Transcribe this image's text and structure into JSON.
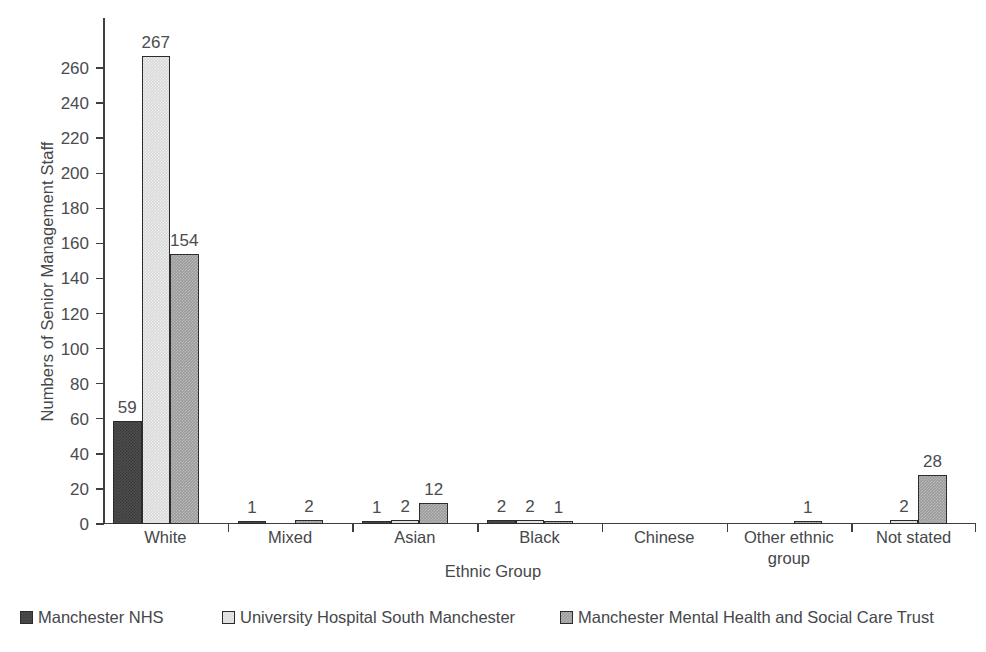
{
  "chart_data": {
    "type": "bar",
    "title": "",
    "xlabel": "Ethnic Group",
    "ylabel": "Numbers of Senior Management Staff",
    "categories": [
      "White",
      "Mixed",
      "Asian",
      "Black",
      "Chinese",
      "Other ethnic group",
      "Not stated"
    ],
    "series": [
      {
        "name": "Manchester NHS",
        "color": "#4e4e4e",
        "values": [
          59,
          1,
          1,
          2,
          0,
          0,
          0
        ]
      },
      {
        "name": "University Hospital South Manchester",
        "color": "#d9d9d9",
        "values": [
          267,
          0,
          2,
          2,
          0,
          0,
          2
        ]
      },
      {
        "name": "Manchester Mental Health and Social Care Trust",
        "color": "#9b9b9b",
        "values": [
          154,
          2,
          12,
          1,
          0,
          1,
          28
        ]
      }
    ],
    "ylim": [
      0,
      267
    ],
    "yticks": [
      0,
      20,
      40,
      60,
      80,
      100,
      120,
      140,
      160,
      180,
      200,
      220,
      240,
      260
    ],
    "ytick_labels": [
      "0",
      "20",
      "40",
      "60",
      "80",
      "100",
      "120",
      "140",
      "160",
      "180",
      "200",
      "220",
      "240",
      "260"
    ],
    "grid": false,
    "legend_position": "bottom",
    "value_labels_shown": true
  },
  "axes": {
    "y_title": "Numbers of Senior Management Staff",
    "x_title": "Ethnic Group"
  },
  "legend": {
    "items": [
      {
        "label": "Manchester NHS",
        "swatch": "dark-gray-swatch"
      },
      {
        "label": "University Hospital South Manchester",
        "swatch": "light-gray-swatch"
      },
      {
        "label": "Manchester Mental Health and Social Care Trust",
        "swatch": "medium-gray-swatch"
      }
    ]
  }
}
